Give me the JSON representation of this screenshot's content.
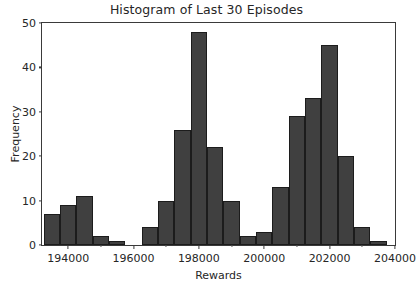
{
  "chart_data": {
    "type": "bar",
    "title": "Histogram of Last 30 Episodes",
    "xlabel": "Rewards",
    "ylabel": "Frequency",
    "xlim": [
      193200,
      204000
    ],
    "ylim": [
      0,
      50
    ],
    "grid": false,
    "legend": null,
    "bin_width": 500,
    "bar_color": "#404040",
    "edge_color": "#1c1c1c",
    "categories": [
      "193250",
      "193750",
      "194250",
      "194750",
      "195250",
      "195750",
      "196250",
      "196750",
      "197250",
      "197750",
      "198250",
      "198750",
      "199250",
      "199750",
      "200250",
      "200750",
      "201250",
      "201750",
      "202250",
      "202750",
      "203250"
    ],
    "bin_starts": [
      193250,
      193750,
      194250,
      194750,
      195250,
      195750,
      196250,
      196750,
      197250,
      197750,
      198250,
      198750,
      199250,
      199750,
      200250,
      200750,
      201250,
      201750,
      202250,
      202750,
      203250
    ],
    "values": [
      7,
      9,
      11,
      2,
      1,
      0,
      4,
      10,
      26,
      48,
      22,
      10,
      2,
      3,
      13,
      29,
      33,
      45,
      20,
      4,
      1
    ],
    "xticks": [
      194000,
      196000,
      198000,
      200000,
      202000,
      204000
    ],
    "xtick_labels": [
      "194000",
      "196000",
      "198000",
      "200000",
      "202000",
      "204000"
    ],
    "yticks": [
      0,
      10,
      20,
      30,
      40,
      50
    ],
    "ytick_labels": [
      "0",
      "10",
      "20",
      "30",
      "40",
      "50"
    ]
  }
}
